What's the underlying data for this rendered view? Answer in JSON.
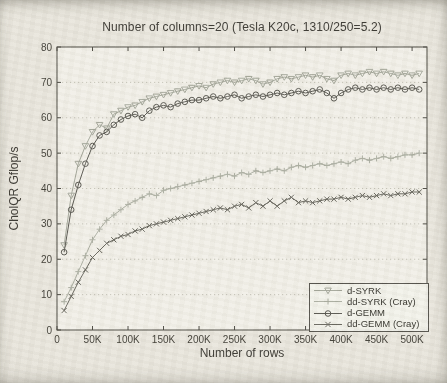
{
  "colors": {
    "paper": "#e9e6dd",
    "plot_bg": "#f2f0e8",
    "axis": "#4a4840",
    "grid": "#bfbdb1",
    "text": "#3a3832",
    "tick_text": "#403e36",
    "series_light": "#a4a79a",
    "series_light2": "#acafa2",
    "series_dark": "#585750",
    "series_dark2": "#67665d"
  },
  "chart_data": {
    "type": "line",
    "title": "Number of columns=20 (Tesla K20c, 1310/250=5.2)",
    "xlabel": "Number of rows",
    "ylabel": "CholQR Gflop/s",
    "xlim": [
      0,
      521000
    ],
    "ylim": [
      0,
      80
    ],
    "grid": "horizontal-dotted",
    "legend_position": "lower-right",
    "x_ticks": [
      {
        "v": 0,
        "label": "0"
      },
      {
        "v": 50000,
        "label": "50K"
      },
      {
        "v": 100000,
        "label": "100K"
      },
      {
        "v": 150000,
        "label": "150K"
      },
      {
        "v": 200000,
        "label": "200K"
      },
      {
        "v": 250000,
        "label": "250K"
      },
      {
        "v": 300000,
        "label": "300K"
      },
      {
        "v": 350000,
        "label": "350K"
      },
      {
        "v": 400000,
        "label": "400K"
      },
      {
        "v": 450000,
        "label": "450K"
      },
      {
        "v": 500000,
        "label": "500K"
      }
    ],
    "y_ticks": [
      {
        "v": 0,
        "label": "0"
      },
      {
        "v": 10,
        "label": "10"
      },
      {
        "v": 20,
        "label": "20"
      },
      {
        "v": 30,
        "label": "30"
      },
      {
        "v": 40,
        "label": "40"
      },
      {
        "v": 50,
        "label": "50"
      },
      {
        "v": 60,
        "label": "60"
      },
      {
        "v": 70,
        "label": "70"
      },
      {
        "v": 80,
        "label": "80"
      }
    ],
    "x": [
      10000,
      20000,
      30000,
      40000,
      50000,
      60000,
      70000,
      80000,
      90000,
      100000,
      110000,
      120000,
      130000,
      140000,
      150000,
      160000,
      170000,
      180000,
      190000,
      200000,
      210000,
      220000,
      230000,
      240000,
      250000,
      260000,
      270000,
      280000,
      290000,
      300000,
      310000,
      320000,
      330000,
      340000,
      350000,
      360000,
      370000,
      380000,
      390000,
      400000,
      410000,
      420000,
      430000,
      440000,
      450000,
      460000,
      470000,
      480000,
      490000,
      500000,
      510000
    ],
    "series": [
      {
        "name": "d-SYRK",
        "marker": "triangle-down",
        "color": "#a4a79a",
        "values": [
          24,
          38,
          47,
          52,
          56,
          58,
          57,
          61,
          62,
          63,
          63.5,
          64.5,
          65.5,
          66,
          66.5,
          67,
          67.5,
          68,
          68.5,
          69,
          68.5,
          69.5,
          70,
          70.5,
          70,
          70.5,
          71,
          70.5,
          69.5,
          70,
          71,
          71.5,
          71,
          71.5,
          72,
          71.5,
          72,
          71,
          70.5,
          72,
          72.5,
          72,
          72.5,
          73,
          72.5,
          73,
          72.5,
          72,
          72.5,
          72,
          72.5
        ]
      },
      {
        "name": "dd-SYRK (Cray)",
        "marker": "plus",
        "color": "#acafa2",
        "values": [
          8,
          12,
          16.5,
          21,
          25.5,
          28.5,
          31,
          32.5,
          34,
          35.5,
          36.5,
          37.5,
          38.5,
          38,
          39.5,
          40,
          40.5,
          41,
          41.5,
          42,
          42.5,
          43,
          43.5,
          44,
          43.5,
          44.5,
          44,
          45,
          44.5,
          45,
          45.5,
          45,
          46,
          46.5,
          46,
          46.5,
          47,
          46.5,
          47,
          47.5,
          47,
          48,
          48.5,
          48,
          48.5,
          49,
          48.5,
          49,
          49.5,
          49.5,
          50
        ]
      },
      {
        "name": "d-GEMM",
        "marker": "circle",
        "color": "#585750",
        "values": [
          22,
          34,
          41,
          47,
          52,
          55,
          56,
          58,
          59.5,
          60.5,
          61,
          60,
          62,
          63,
          63.5,
          63,
          64,
          64.5,
          65,
          65,
          65.5,
          66,
          65.5,
          66,
          66.5,
          65.5,
          66,
          66.5,
          66,
          66.5,
          67,
          66.5,
          67,
          67.5,
          67,
          67.5,
          68,
          67,
          65.5,
          67,
          68,
          68.5,
          68,
          68.5,
          68,
          68.5,
          68,
          68.5,
          68,
          68.5,
          68
        ]
      },
      {
        "name": "dd-GEMM (Cray)",
        "marker": "x",
        "color": "#67665d",
        "values": [
          5.5,
          9.5,
          13.5,
          17,
          20.5,
          22.5,
          24.5,
          25.5,
          26.5,
          27,
          28,
          28.5,
          29.5,
          30,
          30.5,
          31,
          31.5,
          32,
          32.5,
          33,
          33.5,
          34,
          34.5,
          34,
          35,
          35.5,
          34.5,
          36,
          35,
          36.5,
          35,
          36.5,
          37.5,
          36,
          36.5,
          36,
          36.5,
          37,
          37,
          37.5,
          37,
          37.5,
          38,
          37.5,
          38,
          38.5,
          38,
          38.5,
          38.5,
          39,
          39
        ]
      }
    ]
  }
}
